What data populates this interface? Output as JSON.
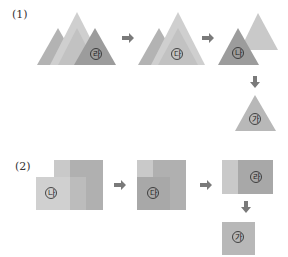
{
  "parts": [
    {
      "label": "(1)",
      "shape": "triangle",
      "steps": [
        {
          "id": "stack-4",
          "front_mark": "라",
          "count": 4
        },
        {
          "id": "stack-3",
          "front_mark": "다",
          "count": 3
        },
        {
          "id": "stack-2",
          "front_mark": "나",
          "count": 2
        },
        {
          "id": "stack-1",
          "front_mark": "가",
          "count": 1
        }
      ]
    },
    {
      "label": "(2)",
      "shape": "square",
      "steps": [
        {
          "id": "stack-3",
          "front_mark": "나",
          "count": 3
        },
        {
          "id": "stack-2",
          "front_mark": "다",
          "count": 2
        },
        {
          "id": "stack-1",
          "front_mark": "라",
          "count": 1
        },
        {
          "id": "single",
          "front_mark": "가",
          "count": 1
        }
      ]
    }
  ],
  "colors": {
    "light": "#c9c9c9",
    "mid": "#b3b3b3",
    "dark": "#9c9c9c",
    "arrow": "#7a7a7a"
  }
}
